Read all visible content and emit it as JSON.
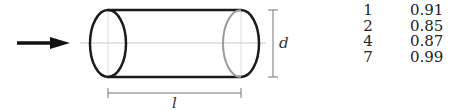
{
  "diagram": {
    "labels": {
      "diameter": "d",
      "length": "l"
    },
    "colors": {
      "stroke": "#1a1a1a",
      "hidden_edge": "#9a9a9a",
      "center_line": "#c8c8c8",
      "dimension": "#777777"
    }
  },
  "table": {
    "rows": [
      {
        "col1": "1",
        "col2": "0.91"
      },
      {
        "col1": "2",
        "col2": "0.85"
      },
      {
        "col1": "4",
        "col2": "0.87"
      },
      {
        "col1": "7",
        "col2": "0.99"
      }
    ]
  }
}
